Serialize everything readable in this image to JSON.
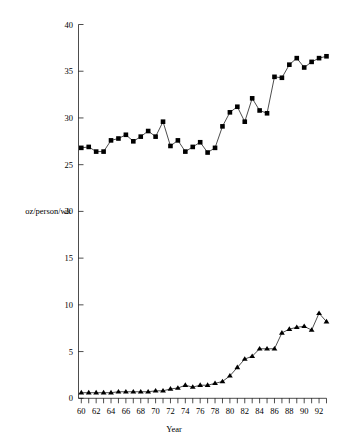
{
  "chart_data": {
    "type": "line",
    "title": "",
    "subtitle": "",
    "xlabel": "Year",
    "ylabel": "oz/person/wk",
    "xlim": [
      59.4,
      93.2
    ],
    "ylim": [
      0,
      40
    ],
    "grid": false,
    "legend": "none",
    "y_ticks": [
      0,
      5,
      10,
      15,
      20,
      25,
      30,
      35,
      40
    ],
    "y_tick_labels": [
      "0",
      "5",
      "10",
      "15",
      "20",
      "25",
      "30",
      "35",
      "40"
    ],
    "x_ticks": [
      60,
      61,
      62,
      63,
      64,
      65,
      66,
      67,
      68,
      69,
      70,
      71,
      72,
      73,
      74,
      75,
      76,
      77,
      78,
      79,
      80,
      81,
      82,
      83,
      84,
      85,
      86,
      87,
      88,
      89,
      90,
      91,
      92,
      93
    ],
    "x_tick_labels": [
      "60",
      "62",
      "64",
      "66",
      "68",
      "70",
      "72",
      "74",
      "76",
      "78",
      "80",
      "82",
      "84",
      "86",
      "88",
      "90",
      "92"
    ],
    "x_labeled_ticks": [
      60,
      62,
      64,
      66,
      68,
      70,
      72,
      74,
      76,
      78,
      80,
      82,
      84,
      86,
      88,
      90,
      92
    ],
    "x": [
      60,
      61,
      62,
      63,
      64,
      65,
      66,
      67,
      68,
      69,
      70,
      71,
      72,
      73,
      74,
      75,
      76,
      77,
      78,
      79,
      80,
      81,
      82,
      83,
      84,
      85,
      86,
      87,
      88,
      89,
      90,
      91,
      92,
      93
    ],
    "series": [
      {
        "name": "upper-series",
        "marker": "square",
        "color": "#000000",
        "values": [
          26.8,
          26.9,
          26.4,
          26.4,
          27.6,
          27.8,
          28.2,
          27.5,
          28.0,
          28.6,
          28.0,
          29.6,
          27.0,
          27.6,
          26.4,
          26.9,
          27.4,
          26.3,
          26.8,
          29.1,
          30.6,
          31.2,
          29.6,
          32.1,
          30.8,
          30.5,
          34.4,
          34.3,
          35.7,
          36.4,
          35.4,
          36.0,
          36.4,
          36.6
        ]
      },
      {
        "name": "lower-series",
        "marker": "triangle",
        "color": "#000000",
        "values": [
          0.6,
          0.6,
          0.6,
          0.6,
          0.6,
          0.7,
          0.7,
          0.7,
          0.7,
          0.7,
          0.8,
          0.8,
          1.0,
          1.1,
          1.4,
          1.2,
          1.4,
          1.4,
          1.6,
          1.8,
          2.4,
          3.3,
          4.2,
          4.5,
          5.3,
          5.3,
          5.3,
          7.0,
          7.4,
          7.6,
          7.7,
          7.3,
          9.1,
          8.2
        ]
      }
    ]
  },
  "axes": {
    "y_axis_title": "oz/person/wk",
    "x_axis_title": "Year"
  }
}
